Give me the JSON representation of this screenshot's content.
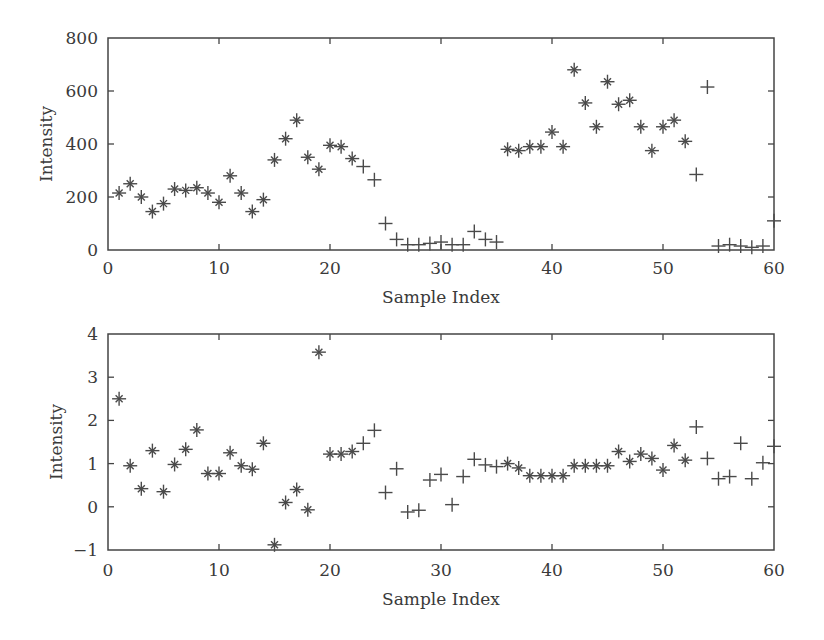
{
  "chart_data": [
    {
      "type": "scatter",
      "title": "",
      "xlabel": "Sample Index",
      "ylabel": "Intensity",
      "xlim": [
        0,
        60
      ],
      "ylim": [
        0,
        800
      ],
      "xticks": [
        0,
        10,
        20,
        30,
        40,
        50,
        60
      ],
      "yticks": [
        0,
        200,
        400,
        600,
        800
      ],
      "grid": false,
      "legend": null,
      "marker_legend": {
        "star": "*",
        "plus": "+"
      },
      "x": [
        1,
        2,
        3,
        4,
        5,
        6,
        7,
        8,
        9,
        10,
        11,
        12,
        13,
        14,
        15,
        16,
        17,
        18,
        19,
        20,
        21,
        22,
        23,
        24,
        25,
        26,
        27,
        28,
        29,
        30,
        31,
        32,
        33,
        34,
        35,
        36,
        37,
        38,
        39,
        40,
        41,
        42,
        43,
        44,
        45,
        46,
        47,
        48,
        49,
        50,
        51,
        52,
        53,
        54,
        55,
        56,
        57,
        58,
        59,
        60
      ],
      "values": [
        215,
        250,
        200,
        145,
        175,
        230,
        225,
        235,
        215,
        180,
        280,
        215,
        145,
        190,
        340,
        420,
        490,
        350,
        305,
        395,
        390,
        345,
        315,
        265,
        100,
        40,
        20,
        20,
        25,
        30,
        20,
        20,
        70,
        40,
        30,
        380,
        375,
        390,
        390,
        445,
        390,
        680,
        555,
        465,
        635,
        550,
        565,
        465,
        375,
        465,
        490,
        410,
        285,
        615,
        15,
        20,
        15,
        10,
        15,
        110
      ],
      "markers": [
        "*",
        "*",
        "*",
        "*",
        "*",
        "*",
        "*",
        "*",
        "*",
        "*",
        "*",
        "*",
        "*",
        "*",
        "*",
        "*",
        "*",
        "*",
        "*",
        "*",
        "*",
        "*",
        "+",
        "+",
        "+",
        "+",
        "+",
        "+",
        "+",
        "+",
        "+",
        "+",
        "+",
        "+",
        "+",
        "*",
        "*",
        "*",
        "*",
        "*",
        "*",
        "*",
        "*",
        "*",
        "*",
        "*",
        "*",
        "*",
        "*",
        "*",
        "*",
        "*",
        "+",
        "+",
        "+",
        "+",
        "+",
        "+",
        "+",
        "+"
      ]
    },
    {
      "type": "scatter",
      "title": "",
      "xlabel": "Sample Index",
      "ylabel": "Intensity",
      "xlim": [
        0,
        60
      ],
      "ylim": [
        -1,
        4
      ],
      "xticks": [
        0,
        10,
        20,
        30,
        40,
        50,
        60
      ],
      "yticks": [
        -1,
        0,
        1,
        2,
        3,
        4
      ],
      "grid": false,
      "legend": null,
      "x": [
        1,
        2,
        3,
        4,
        5,
        6,
        7,
        8,
        9,
        10,
        11,
        12,
        13,
        14,
        15,
        16,
        17,
        18,
        19,
        20,
        21,
        22,
        23,
        24,
        25,
        26,
        27,
        28,
        29,
        30,
        31,
        32,
        33,
        34,
        35,
        36,
        37,
        38,
        39,
        40,
        41,
        42,
        43,
        44,
        45,
        46,
        47,
        48,
        49,
        50,
        51,
        52,
        53,
        54,
        55,
        56,
        57,
        58,
        59,
        60
      ],
      "values": [
        2.5,
        0.95,
        0.42,
        1.3,
        0.35,
        0.98,
        1.33,
        1.78,
        0.77,
        0.77,
        1.25,
        0.95,
        0.87,
        1.47,
        -0.88,
        0.1,
        0.4,
        -0.07,
        3.58,
        1.22,
        1.22,
        1.28,
        1.47,
        1.77,
        0.33,
        0.88,
        -0.12,
        -0.08,
        0.62,
        0.75,
        0.05,
        0.7,
        1.1,
        0.97,
        0.93,
        1.0,
        0.9,
        0.72,
        0.72,
        0.72,
        0.72,
        0.95,
        0.95,
        0.95,
        0.95,
        1.28,
        1.05,
        1.22,
        1.12,
        0.85,
        1.42,
        1.08,
        1.85,
        1.12,
        0.65,
        0.7,
        1.47,
        0.65,
        1.02,
        1.4
      ],
      "markers": [
        "*",
        "*",
        "*",
        "*",
        "*",
        "*",
        "*",
        "*",
        "*",
        "*",
        "*",
        "*",
        "*",
        "*",
        "*",
        "*",
        "*",
        "*",
        "*",
        "*",
        "*",
        "*",
        "+",
        "+",
        "+",
        "+",
        "+",
        "+",
        "+",
        "+",
        "+",
        "+",
        "+",
        "+",
        "+",
        "*",
        "*",
        "*",
        "*",
        "*",
        "*",
        "*",
        "*",
        "*",
        "*",
        "*",
        "*",
        "*",
        "*",
        "*",
        "*",
        "*",
        "+",
        "+",
        "+",
        "+",
        "+",
        "+",
        "+",
        "+"
      ]
    }
  ],
  "charts": {
    "top": {
      "ylabel": "Intensity",
      "xlabel": "Sample Index",
      "ytick_labels": [
        "0",
        "200",
        "400",
        "600",
        "800"
      ],
      "xtick_labels": [
        "0",
        "10",
        "20",
        "30",
        "40",
        "50",
        "60"
      ]
    },
    "bottom": {
      "ylabel": "Intensity",
      "xlabel": "Sample Index",
      "ytick_labels": [
        "−1",
        "0",
        "1",
        "2",
        "3",
        "4"
      ],
      "xtick_labels": [
        "0",
        "10",
        "20",
        "30",
        "40",
        "50",
        "60"
      ]
    }
  },
  "colors": {
    "axis": "#444444",
    "marker": "#4a4a4a",
    "text": "#3a3a3a"
  }
}
